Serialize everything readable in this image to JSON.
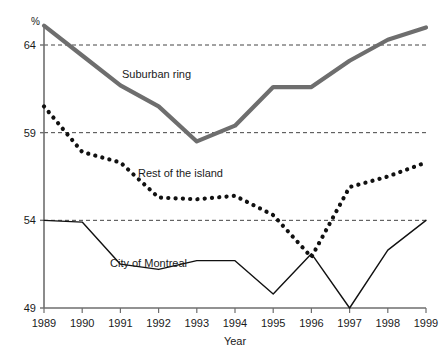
{
  "chart_data": {
    "type": "line",
    "title": "",
    "subtitle": "",
    "xlabel": "Year",
    "ylabel": "%",
    "yunit": "%",
    "categories": [
      "1989",
      "1990",
      "1991",
      "1992",
      "1993",
      "1994",
      "1995",
      "1996",
      "1997",
      "1998",
      "1999"
    ],
    "x": [
      1989,
      1990,
      1991,
      1992,
      1993,
      1994,
      1995,
      1996,
      1997,
      1998,
      1999
    ],
    "xlim": [
      1989,
      1999
    ],
    "ylim": [
      49,
      65.1
    ],
    "yticks": [
      49,
      54,
      59,
      64
    ],
    "ytick_labels": [
      "49",
      "54",
      "59",
      "64"
    ],
    "grid": "horizontal-dashed",
    "legend": "inline-labels",
    "series": [
      {
        "name": "Suburban ring",
        "style": "solid-thick",
        "color": "#6e6e6e",
        "values": [
          65.1,
          63.4,
          61.7,
          60.5,
          58.5,
          59.4,
          61.6,
          61.6,
          63.1,
          64.3,
          65.0
        ]
      },
      {
        "name": "Rest of the island",
        "style": "dotted-thick",
        "color": "#111111",
        "values": [
          60.5,
          57.9,
          57.3,
          55.3,
          55.2,
          55.4,
          54.3,
          51.9,
          55.9,
          56.5,
          57.3
        ]
      },
      {
        "name": "City of Montreal",
        "style": "solid-thin",
        "color": "#111111",
        "values": [
          54.0,
          53.9,
          51.5,
          51.2,
          51.7,
          51.7,
          49.8,
          52.1,
          49.0,
          52.3,
          54.0
        ]
      }
    ],
    "annotations": [
      {
        "text": "Suburban ring",
        "x": 122,
        "y": 78
      },
      {
        "text": "Rest of the island",
        "x": 138,
        "y": 177
      },
      {
        "text": "City of Montreal",
        "x": 110,
        "y": 267
      }
    ]
  },
  "axes": {
    "y_unit_label": "%",
    "x_axis_title": "Year"
  }
}
